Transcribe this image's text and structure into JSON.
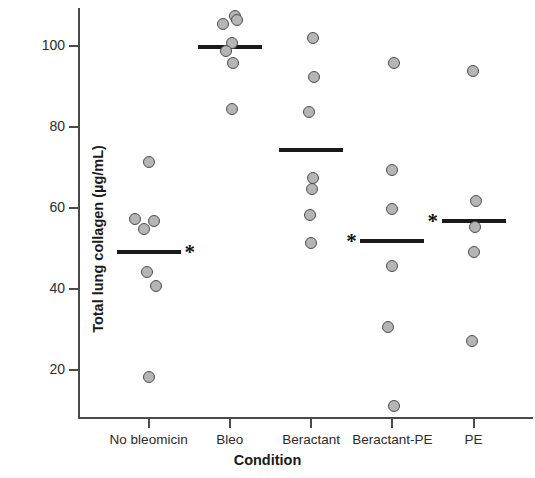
{
  "chart_data": {
    "type": "scatter",
    "title": "",
    "xlabel": "Condition",
    "ylabel": "Total lung collagen  (µg/mL)",
    "categories": [
      "No bleomicin",
      "Bleo",
      "Beractant",
      "Beractant-PE",
      "PE"
    ],
    "ylim": [
      8,
      109
    ],
    "yticks": [
      20,
      40,
      60,
      80,
      100
    ],
    "ytick_labels": [
      "20",
      "40",
      "60",
      "80",
      "100"
    ],
    "grid": false,
    "legend": null,
    "significance_marker": "*",
    "point_color": "#b5b5b5",
    "point_edge_color": "#4d4d4d",
    "mean_line_color": "#1a1a1a",
    "axis_color": "#4a4a4a",
    "groups": [
      {
        "name": "No bleomicin",
        "values": [
          71.0,
          57.0,
          56.5,
          54.5,
          44.0,
          40.5,
          18.0
        ],
        "x_jitter": [
          0.0,
          -0.32,
          0.12,
          -0.1,
          -0.04,
          0.18,
          0.02
        ],
        "mean": 49.0,
        "significant": true,
        "star_side": "right"
      },
      {
        "name": "Bleo",
        "values": [
          107.0,
          106.0,
          105.0,
          100.5,
          98.5,
          95.5,
          84.0
        ],
        "x_jitter": [
          0.12,
          0.18,
          -0.16,
          0.06,
          -0.1,
          0.08,
          0.06
        ],
        "mean": 99.5,
        "significant": false,
        "star_side": null
      },
      {
        "name": "Beractant",
        "values": [
          101.5,
          92.0,
          83.5,
          67.0,
          64.5,
          58.0,
          51.0
        ],
        "x_jitter": [
          0.04,
          0.06,
          -0.06,
          0.04,
          0.02,
          -0.02,
          0.0
        ],
        "mean": 74.0,
        "significant": false,
        "star_side": null
      },
      {
        "name": "Beractant-PE",
        "values": [
          95.5,
          69.0,
          59.5,
          45.5,
          30.5,
          11.0
        ],
        "x_jitter": [
          0.04,
          -0.02,
          0.0,
          -0.02,
          -0.1,
          0.04
        ],
        "mean": 51.5,
        "significant": true,
        "star_side": "left"
      },
      {
        "name": "PE",
        "values": [
          93.5,
          61.5,
          55.0,
          49.0,
          27.0
        ],
        "x_jitter": [
          -0.02,
          0.06,
          0.04,
          0.0,
          -0.04
        ],
        "mean": 56.5,
        "significant": true,
        "star_side": "left"
      }
    ]
  }
}
